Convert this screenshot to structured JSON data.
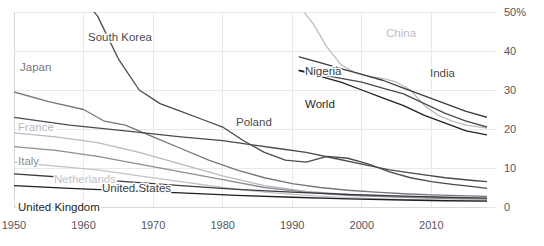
{
  "chart_data": {
    "type": "line",
    "title": "",
    "xlabel": "",
    "ylabel": "",
    "ylim": [
      0,
      50
    ],
    "xlim": [
      1950,
      2018
    ],
    "grid": true,
    "legend_position": "inline-labels",
    "y_ticks": [
      "0",
      "10",
      "20",
      "30",
      "40",
      "50%"
    ],
    "y_tick_values": [
      0,
      10,
      20,
      30,
      40,
      50
    ],
    "x_ticks": [
      "1950",
      "1960",
      "1970",
      "1980",
      "1990",
      "2000",
      "2010"
    ],
    "x_tick_values": [
      1950,
      1960,
      1970,
      1980,
      1990,
      2000,
      2010
    ],
    "series": [
      {
        "name": "South Korea",
        "color": "#4a4a4f",
        "label_x": 88,
        "label_y": 41,
        "label_anchor": "start",
        "x": [
          1953,
          1957,
          1960,
          1962,
          1965,
          1968,
          1971,
          1974,
          1977,
          1980,
          1983,
          1986,
          1989,
          1992,
          1995,
          1998,
          2001,
          2004,
          2007,
          2010,
          2013,
          2016,
          2018
        ],
        "values": [
          64.0,
          58.0,
          53.0,
          49.0,
          38.0,
          30.0,
          26.5,
          24.5,
          22.5,
          20.5,
          17.0,
          14.0,
          12.0,
          11.5,
          13.0,
          12.5,
          11.0,
          9.0,
          7.5,
          6.5,
          5.8,
          5.2,
          4.8
        ]
      },
      {
        "name": "Japan",
        "color": "#76767c",
        "label_x": 20,
        "label_y": 71,
        "label_anchor": "start",
        "x": [
          1950,
          1955,
          1960,
          1963,
          1966,
          1970,
          1974,
          1978,
          1982,
          1986,
          1990,
          1994,
          1998,
          2002,
          2006,
          2010,
          2014,
          2018
        ],
        "values": [
          29.5,
          27.0,
          25.0,
          22.0,
          21.0,
          18.0,
          15.0,
          12.0,
          9.5,
          7.5,
          6.0,
          5.0,
          4.3,
          3.8,
          3.4,
          3.1,
          2.9,
          2.7
        ]
      },
      {
        "name": "Poland",
        "color": "#4a4a4f",
        "label_x": 236,
        "label_y": 126,
        "label_anchor": "start",
        "x": [
          1950,
          1958,
          1966,
          1974,
          1980,
          1984,
          1988,
          1992,
          1996,
          2000,
          2004,
          2008,
          2012,
          2016,
          2018
        ],
        "values": [
          23.0,
          21.0,
          19.5,
          18.0,
          17.0,
          16.0,
          15.0,
          14.0,
          12.5,
          11.0,
          9.5,
          8.5,
          7.5,
          6.8,
          6.5
        ]
      },
      {
        "name": "France",
        "color": "#b9b9bf",
        "label_x": 18,
        "label_y": 131,
        "label_anchor": "start",
        "x": [
          1950,
          1956,
          1962,
          1968,
          1974,
          1980,
          1986,
          1992,
          1998,
          2004,
          2010,
          2014,
          2018
        ],
        "values": [
          19.0,
          18.0,
          16.5,
          14.0,
          11.0,
          8.0,
          5.5,
          4.0,
          3.2,
          2.8,
          2.5,
          2.3,
          2.2
        ]
      },
      {
        "name": "Italy",
        "color": "#8d8d93",
        "label_x": 18,
        "label_y": 165,
        "label_anchor": "start",
        "x": [
          1950,
          1956,
          1962,
          1968,
          1974,
          1980,
          1986,
          1992,
          1998,
          2004,
          2010,
          2014,
          2018
        ],
        "values": [
          15.5,
          14.5,
          13.0,
          11.0,
          9.0,
          7.0,
          5.0,
          3.8,
          3.0,
          2.6,
          2.3,
          2.1,
          2.0
        ]
      },
      {
        "name": "Netherlands",
        "color": "#c2c2c8",
        "label_x": 54,
        "label_y": 183,
        "label_anchor": "start",
        "x": [
          1950,
          1956,
          1962,
          1968,
          1974,
          1980,
          1986,
          1992,
          1998,
          2004,
          2010,
          2014,
          2018
        ],
        "values": [
          11.5,
          10.5,
          9.5,
          8.0,
          6.5,
          5.0,
          3.8,
          3.0,
          2.4,
          2.0,
          1.8,
          1.7,
          1.6
        ]
      },
      {
        "name": "United States",
        "color": "#3b3b40",
        "label_x": 102,
        "label_y": 192,
        "label_anchor": "start",
        "x": [
          1950,
          1958,
          1966,
          1974,
          1982,
          1990,
          1998,
          2006,
          2012,
          2018
        ],
        "values": [
          8.5,
          7.5,
          6.5,
          5.5,
          4.5,
          3.8,
          3.2,
          2.8,
          2.5,
          2.3
        ]
      },
      {
        "name": "United Kingdom",
        "color": "#1f1f24",
        "label_x": 18,
        "label_y": 211,
        "label_anchor": "start",
        "x": [
          1950,
          1958,
          1966,
          1974,
          1982,
          1990,
          1998,
          2006,
          2012,
          2018
        ],
        "values": [
          5.5,
          4.8,
          4.2,
          3.6,
          3.0,
          2.5,
          2.1,
          1.8,
          1.6,
          1.5
        ]
      },
      {
        "name": "China",
        "color": "#bdbdc3",
        "label_x": 386,
        "label_y": 37,
        "label_anchor": "start",
        "x": [
          1991,
          1993,
          1995,
          1997,
          1999,
          2001,
          2003,
          2005,
          2007,
          2009,
          2011,
          2013,
          2015,
          2017,
          2018
        ],
        "values": [
          51.5,
          47.0,
          41.0,
          36.5,
          34.5,
          33.5,
          33.0,
          32.0,
          30.0,
          26.0,
          23.5,
          22.0,
          21.0,
          20.5,
          20.2
        ]
      },
      {
        "name": "Nigeria",
        "color": "#3b3b40",
        "label_x": 305,
        "label_y": 75,
        "label_anchor": "start",
        "x": [
          1991,
          1994,
          1997,
          2000,
          2003,
          2006,
          2009,
          2012,
          2015,
          2018
        ],
        "values": [
          38.5,
          37.0,
          35.5,
          34.0,
          32.5,
          30.5,
          28.5,
          26.5,
          24.5,
          23.0
        ]
      },
      {
        "name": "India",
        "color": "#4a4a4f",
        "label_x": 430,
        "label_y": 77,
        "label_anchor": "start",
        "x": [
          1991,
          1994,
          1997,
          2000,
          2003,
          2006,
          2009,
          2012,
          2015,
          2018
        ],
        "values": [
          35.0,
          34.0,
          33.0,
          32.0,
          30.5,
          29.0,
          26.5,
          24.0,
          22.0,
          20.5
        ]
      },
      {
        "name": "World",
        "color": "#1f1f24",
        "label_x": 305,
        "label_y": 108,
        "label_anchor": "start",
        "x": [
          1991,
          1994,
          1997,
          2000,
          2003,
          2006,
          2009,
          2012,
          2015,
          2018
        ],
        "values": [
          35.0,
          33.5,
          32.0,
          30.0,
          28.0,
          26.0,
          23.5,
          21.5,
          19.5,
          18.5
        ]
      }
    ]
  },
  "plot_geometry": {
    "left": 14,
    "right": 487,
    "top": 12,
    "bottom": 207
  },
  "colors": {
    "background": "#ffffff",
    "gridline": "#e9e9ec",
    "tick_text": "#55555c"
  }
}
